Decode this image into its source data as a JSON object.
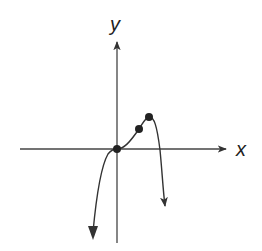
{
  "diagram": {
    "type": "function-graph",
    "axes": {
      "x_label": "x",
      "y_label": "y"
    },
    "marked_points": [
      {
        "name": "origin-point",
        "px": 117,
        "py": 149
      },
      {
        "name": "inflection-point",
        "px": 139,
        "py": 129
      },
      {
        "name": "local-max-point",
        "px": 149,
        "py": 117
      }
    ],
    "colors": {
      "stroke": "#333333",
      "background": "#ffffff",
      "point_fill": "#222222"
    }
  }
}
